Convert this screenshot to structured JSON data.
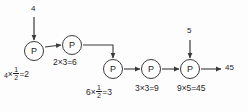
{
  "diagram": {
    "type": "flow-chain",
    "node_glyph": "P",
    "inputs": [
      {
        "name": "input-top-left",
        "value": "4",
        "target_node": 1
      },
      {
        "name": "input-top-right",
        "value": "5",
        "target_node": 5
      }
    ],
    "output": {
      "name": "final-output",
      "value": "45"
    },
    "nodes": [
      {
        "id": 1,
        "label": "P",
        "cx": 34,
        "cy": 51
      },
      {
        "id": 2,
        "label": "P",
        "cx": 72,
        "cy": 45
      },
      {
        "id": 3,
        "label": "P",
        "cx": 113,
        "cy": 69
      },
      {
        "id": 4,
        "label": "P",
        "cx": 151,
        "cy": 69
      },
      {
        "id": 5,
        "label": "P",
        "cx": 190,
        "cy": 69
      }
    ],
    "operations": [
      {
        "node": 1,
        "text": "4×½=2",
        "operand_a": "4",
        "operator": "×",
        "fraction_num": "1",
        "fraction_den": "2",
        "equals": "=2"
      },
      {
        "node": 2,
        "text": "2×3=6",
        "operand_a": "2",
        "operator": "×",
        "operand_b": "3",
        "equals": "=6"
      },
      {
        "node": 3,
        "text": "6×½=3",
        "operand_a": "6",
        "operator": "×",
        "fraction_num": "1",
        "fraction_den": "2",
        "equals": "=3"
      },
      {
        "node": 4,
        "text": "3×3=9",
        "operand_a": "3",
        "operator": "×",
        "operand_b": "3",
        "equals": "=9"
      },
      {
        "node": 5,
        "text": "9×5=45",
        "operand_a": "9",
        "operator": "×",
        "operand_b": "5",
        "equals": "=45"
      }
    ],
    "colors": {
      "stroke": "#3a3a3a",
      "text": "#1d1d1d",
      "background": "#fdfdfd"
    }
  }
}
